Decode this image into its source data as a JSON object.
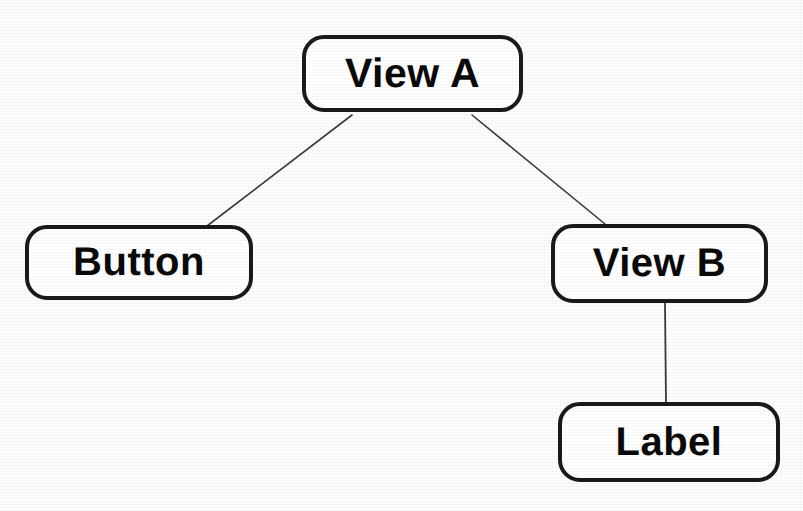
{
  "diagram": {
    "type": "tree",
    "background_color": "#fdfdfd",
    "node_fill_color": "#ffffff",
    "node_border_color": "#1a1a1a",
    "edge_color": "#3a3a3a",
    "text_color": "#0a0a0a",
    "nodes": [
      {
        "id": "view-a",
        "label": "View A",
        "x": 302,
        "y": 35,
        "width": 221,
        "height": 77
      },
      {
        "id": "button",
        "label": "Button",
        "x": 25,
        "y": 225,
        "width": 228,
        "height": 75
      },
      {
        "id": "view-b",
        "label": "View B",
        "x": 551,
        "y": 224,
        "width": 217,
        "height": 79
      },
      {
        "id": "label",
        "label": "Label",
        "x": 558,
        "y": 402,
        "width": 222,
        "height": 80
      }
    ],
    "edges": [
      {
        "id": "edge-view-a-button",
        "from": "view-a",
        "to": "button",
        "x1": 352,
        "y1": 115,
        "x2": 207,
        "y2": 226
      },
      {
        "id": "edge-view-a-view-b",
        "from": "view-a",
        "to": "view-b",
        "x1": 472,
        "y1": 115,
        "x2": 605,
        "y2": 224
      },
      {
        "id": "edge-view-b-label",
        "from": "view-b",
        "to": "label",
        "x1": 665,
        "y1": 303,
        "x2": 666,
        "y2": 402
      }
    ]
  }
}
